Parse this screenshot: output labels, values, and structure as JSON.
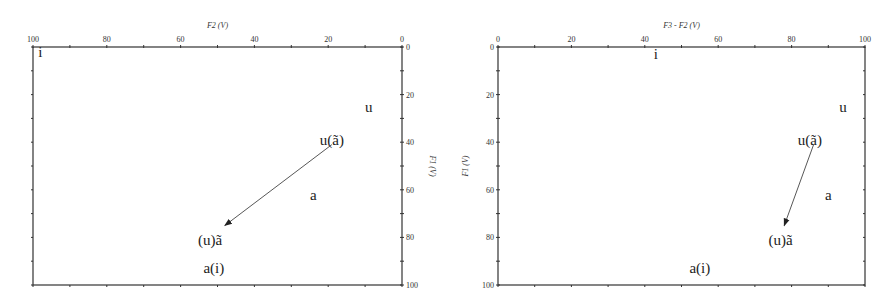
{
  "chart_data": [
    {
      "type": "scatter",
      "title": "",
      "xlabel": "F2 (V)",
      "ylabel": "F1 (V)",
      "xlim": [
        100,
        0
      ],
      "ylim": [
        100,
        0
      ],
      "x_axis_position": "top",
      "y_axis_position": "right",
      "x_ticks": [
        "100",
        "80",
        "60",
        "40",
        "20",
        "0"
      ],
      "y_ticks": [
        "0",
        "20",
        "40",
        "60",
        "80",
        "100"
      ],
      "grid": false,
      "points": [
        {
          "label": "i",
          "x": 98,
          "y": 2
        },
        {
          "label": "u",
          "x": 9,
          "y": 25
        },
        {
          "label": "u(ã)",
          "x": 19,
          "y": 39
        },
        {
          "label": "a",
          "x": 24,
          "y": 62
        },
        {
          "label": "(u)ã",
          "x": 52,
          "y": 81
        },
        {
          "label": "a(i)",
          "x": 51,
          "y": 93
        }
      ],
      "annotations": [
        {
          "type": "arrow",
          "from": [
            19,
            41
          ],
          "to": [
            48,
            75
          ]
        }
      ]
    },
    {
      "type": "scatter",
      "title": "",
      "xlabel": "F3 - F2 (V)",
      "ylabel": "F1 (V)",
      "xlim": [
        0,
        100
      ],
      "ylim": [
        100,
        0
      ],
      "x_axis_position": "top",
      "y_axis_position": "left",
      "x_ticks": [
        "0",
        "20",
        "40",
        "60",
        "80",
        "100"
      ],
      "y_ticks": [
        "0",
        "20",
        "40",
        "60",
        "80",
        "100"
      ],
      "grid": false,
      "points": [
        {
          "label": "i",
          "x": 43,
          "y": 3
        },
        {
          "label": "u",
          "x": 94,
          "y": 25
        },
        {
          "label": "u(ã)",
          "x": 85,
          "y": 39
        },
        {
          "label": "a",
          "x": 90,
          "y": 62
        },
        {
          "label": "(u)ã",
          "x": 77,
          "y": 81
        },
        {
          "label": "a(i)",
          "x": 55,
          "y": 93
        }
      ],
      "annotations": [
        {
          "type": "arrow",
          "from": [
            86,
            41
          ],
          "to": [
            78,
            75
          ]
        }
      ]
    }
  ]
}
